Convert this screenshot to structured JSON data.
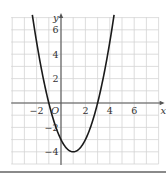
{
  "chart_data": {
    "type": "line",
    "title": "",
    "xlabel": "x",
    "ylabel": "y",
    "origin_label": "O",
    "function": "y = x^2 - 2x - 3",
    "vertex": [
      1,
      -4
    ],
    "roots": [
      -1,
      3
    ],
    "y_intercept": -3,
    "xlim": [
      -4,
      8
    ],
    "ylim": [
      -5,
      7
    ],
    "grid": true,
    "grid_step": 1,
    "x_ticks": [
      {
        "value": -2,
        "label": "−2"
      },
      {
        "value": 2,
        "label": "2"
      },
      {
        "value": 4,
        "label": "4"
      },
      {
        "value": 6,
        "label": "6"
      }
    ],
    "y_ticks": [
      {
        "value": 6,
        "label": "6"
      },
      {
        "value": 4,
        "label": "4"
      },
      {
        "value": 2,
        "label": "2"
      },
      {
        "value": -2,
        "label": "−2"
      },
      {
        "value": -4,
        "label": "−4"
      }
    ],
    "series": [
      {
        "name": "parabola",
        "x": [
          -2.3,
          -2,
          -1.5,
          -1,
          -0.5,
          0,
          0.5,
          1,
          1.5,
          2,
          2.5,
          3,
          3.5,
          4,
          4.3
        ],
        "y": [
          6.89,
          5,
          2.25,
          0,
          -1.75,
          -3,
          -3.75,
          -4,
          -3.75,
          -3,
          -1.75,
          0,
          2.25,
          5,
          6.89
        ]
      }
    ],
    "colors": {
      "curve": "#1a1a1a",
      "axis": "#555555",
      "grid": "#d4d4d4",
      "label": "#333333"
    }
  }
}
